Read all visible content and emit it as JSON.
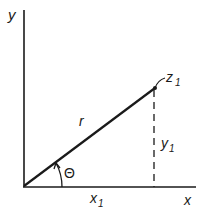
{
  "diagram": {
    "colors": {
      "ink": "#1a1a1a",
      "background": "#ffffff"
    },
    "axes": {
      "y_label": "y",
      "x_label": "x"
    },
    "point": {
      "label_main": "z",
      "label_sub": "1"
    },
    "radius_label": "r",
    "angle_label": "Θ",
    "x_projection": {
      "label_main": "x",
      "label_sub": "1"
    },
    "y_projection": {
      "label_main": "y",
      "label_sub": "1"
    }
  }
}
